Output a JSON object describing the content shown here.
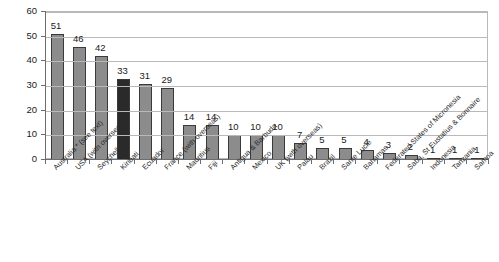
{
  "chart_data": {
    "type": "bar",
    "title": "",
    "subtitle": "",
    "xlabel": "",
    "ylabel": "",
    "ylim": [
      0,
      60
    ],
    "ytick_step": 10,
    "yticks": [
      "0",
      "10",
      "20",
      "30",
      "40",
      "50",
      "60"
    ],
    "grid": true,
    "legend": false,
    "orientation": "vertical",
    "categories": [
      "Australia * (see text)",
      "USA (with overseas)",
      "Seychelles",
      "Kiribati",
      "Ecuador",
      "France (with overseas)",
      "Mauritius",
      "Fiji",
      "Antigua & Barbuda",
      "Mexico",
      "UK (with overseas)",
      "Palau",
      "Brazil",
      "Sante Lucie",
      "Bahamas",
      "Federated States of Micronesia",
      "Saba, St Eustatius & Bonnaire",
      "Indonesia",
      "Tanzania",
      "Samoa"
    ],
    "values": [
      51,
      46,
      42,
      33,
      31,
      29,
      14,
      14,
      10,
      10,
      10,
      7,
      5,
      5,
      4,
      3,
      2,
      1,
      1,
      1
    ],
    "data_labels": [
      "51",
      "46",
      "42",
      "33",
      "31",
      "29",
      "14",
      "14",
      "10",
      "10",
      "10",
      "7",
      "5",
      "5",
      "4",
      "3",
      "2",
      "1",
      "1",
      "1"
    ],
    "highlighted_category": "Kiribati",
    "highlighted_index": 3,
    "colors": {
      "bar_fill": "#8c8c8c",
      "bar_highlight_fill": "#2a2a2a",
      "bar_outline": "#3a3a3a",
      "gridline": "#b9b9b9",
      "axis": "#6d6d6d",
      "text": "#1a1a1a",
      "background": "#ffffff"
    }
  }
}
